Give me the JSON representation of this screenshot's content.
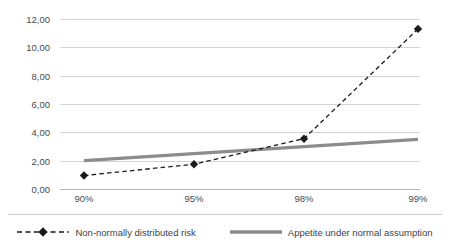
{
  "chart_data": {
    "type": "line",
    "title": "",
    "xlabel": "",
    "ylabel": "",
    "categories": [
      "90%",
      "95%",
      "98%",
      "99%"
    ],
    "ylim": [
      0,
      12
    ],
    "yticks": [
      "0,00",
      "2,00",
      "4,00",
      "6,00",
      "8,00",
      "10,00",
      "12,00"
    ],
    "ytick_values": [
      0,
      2,
      4,
      6,
      8,
      10,
      12
    ],
    "grid": "horizontal",
    "legend_position": "bottom",
    "decimal_separator": ",",
    "series": [
      {
        "name": "Non-normally distributed risk",
        "values": [
          0.95,
          1.75,
          3.55,
          11.3
        ],
        "style": "dashed",
        "marker": "diamond",
        "color": "#1a1a1a"
      },
      {
        "name": "Appetite under normal assumption",
        "values": [
          2.0,
          2.5,
          3.05,
          3.5
        ],
        "style": "solid",
        "marker": "none",
        "color": "#8c8c8c"
      }
    ]
  },
  "legend": {
    "items": [
      {
        "label": "Non-normally distributed risk",
        "swatch": "dashed-diamond-swatch"
      },
      {
        "label": "Appetite under normal assumption",
        "swatch": "solid-thick-gray-swatch"
      }
    ]
  },
  "colors": {
    "series_risk": "#1a1a1a",
    "series_appetite": "#8c8c8c",
    "gridline": "#d2d2d2",
    "axis": "#b5b5b5",
    "text": "#4a4a4a",
    "background": "#ffffff"
  }
}
